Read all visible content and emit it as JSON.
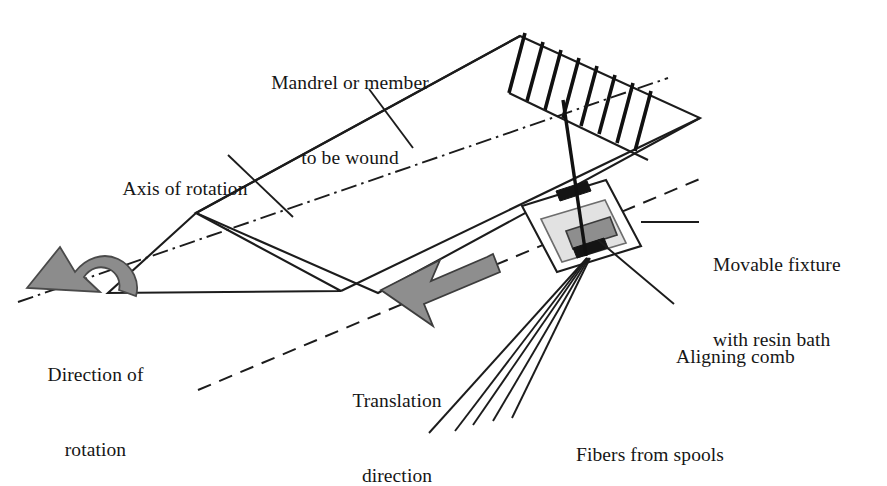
{
  "figure": {
    "background_color": "#ffffff",
    "line_color": "#1c1c1c",
    "accent_gray": "#8e8e8e",
    "bath_gray": "#e2e2e2",
    "width": 887,
    "height": 452
  },
  "labels": {
    "mandrel": {
      "line1": "Mandrel or member",
      "line2": "to be wound",
      "x": 256,
      "y": 22
    },
    "axis_of_rotation": {
      "line1": "Axis of rotation",
      "x": 104,
      "y": 126
    },
    "movable_fixture": {
      "line1": "Movable fixture",
      "line2": "with resin bath",
      "x": 716,
      "y": 202
    },
    "aligning_comb": {
      "line1": "Aligning comb",
      "x": 676,
      "y": 293
    },
    "direction_of_rotation": {
      "line1": "Direction of",
      "line2": "rotation",
      "x": 22,
      "y": 312
    },
    "translation_direction": {
      "line1": "Translation",
      "line2": "direction",
      "x": 330,
      "y": 338
    },
    "fibers_from_spools": {
      "line1": "Fibers from spools",
      "x": 578,
      "y": 392
    }
  },
  "geometry": {
    "mandrel_body": "M 196,213 L 520,36 L 700,118 L 341,291 Z",
    "mandrel_cone_top": "196,213 244,199 341,291",
    "mandrel_cone_bottom": "196,213 341,291 108,293",
    "mandrel_ridge": "M 244,199 L 564,14",
    "mandrel_ridge_back": "M 244,199 L 196,213",
    "cone_front_left": "M 108,293 L 196,213",
    "cone_front_right": "M 108,293 L 341,291",
    "axis_centerline": "M 20,300 L 664,80",
    "translation_line": "M 200,388 L 700,178",
    "winding_top_edge": "M 520,36 L 700,118",
    "winding_bands_count": 8,
    "band_start_top": [
      509,
      92
    ],
    "band_end_top": [
      620,
      36
    ],
    "band_offset": [
      84,
      93
    ],
    "fiber_tow": "M 586,255 L 566,105",
    "fibers_count": 5,
    "fiber_origin": [
      587,
      258
    ],
    "fiber_ends": [
      [
        430,
        432
      ],
      [
        455,
        430
      ],
      [
        472,
        424
      ],
      [
        492,
        420
      ],
      [
        511,
        418
      ]
    ],
    "fixture_outer_box": "522,206 606,180 641,246 557,272",
    "fixture_bath_box": "540,228 600,208 620,248 560,268",
    "fixture_bar": "565,234 608,219 616,239 573,254",
    "comb_upper": "556,192 586,182 590,192 560,202",
    "comb_lower": "574,249 604,239 608,249 578,259",
    "translation_arrow": "M 497,258 L 505,277 L 408,314 L 420,330 L 381,328 L 385,289 L 397,304 Z",
    "rotation_arrow": "M 40,287 L 24,269 L 56,250 L 92,247 L 122,262 L 133,284 L 116,292 L 105,272 L 82,262 L 58,264 L 36,276 L 52,294 Z",
    "leaders": {
      "mandrel": "M 370,90 L 412,147",
      "axis": "M 229,156 L 292,216",
      "movable_fixture": "M 641,222 L 697,222",
      "aligning_comb": "M 599,241 L 673,303"
    }
  }
}
